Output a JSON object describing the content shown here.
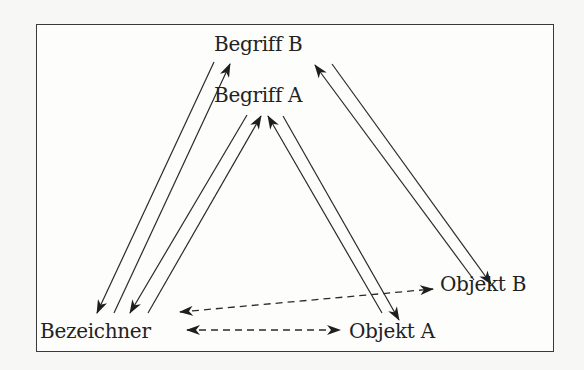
{
  "diagram": {
    "type": "semiotic-triangle",
    "frame": {
      "border_color": "#3a3a3a",
      "background": "#fdfdfb"
    },
    "nodes": [
      {
        "id": "begriff_b",
        "label": "Begriff B",
        "x": 214,
        "y": 35
      },
      {
        "id": "begriff_a",
        "label": "Begriff A",
        "x": 214,
        "y": 86
      },
      {
        "id": "bezeichner",
        "label": "Bezeichner",
        "x": 40,
        "y": 322
      },
      {
        "id": "objekt_a",
        "label": "Objekt A",
        "x": 348,
        "y": 322
      },
      {
        "id": "objekt_b",
        "label": "Objekt B",
        "x": 440,
        "y": 275
      }
    ],
    "edges": [
      {
        "from": "begriff_b",
        "to": "bezeichner",
        "style": "solid",
        "directed": true
      },
      {
        "from": "bezeichner",
        "to": "begriff_b",
        "style": "solid",
        "directed": true
      },
      {
        "from": "begriff_a",
        "to": "bezeichner",
        "style": "solid",
        "directed": true
      },
      {
        "from": "bezeichner",
        "to": "begriff_a",
        "style": "solid",
        "directed": true
      },
      {
        "from": "objekt_a",
        "to": "begriff_a",
        "style": "solid",
        "directed": true
      },
      {
        "from": "begriff_a",
        "to": "objekt_a",
        "style": "solid",
        "directed": true
      },
      {
        "from": "objekt_b",
        "to": "begriff_b",
        "style": "solid",
        "directed": true
      },
      {
        "from": "begriff_b",
        "to": "objekt_b",
        "style": "solid",
        "directed": true
      },
      {
        "from": "bezeichner",
        "to": "objekt_a",
        "style": "dashed",
        "directed": "both"
      },
      {
        "from": "bezeichner",
        "to": "objekt_b",
        "style": "dashed",
        "directed": "both"
      }
    ]
  }
}
